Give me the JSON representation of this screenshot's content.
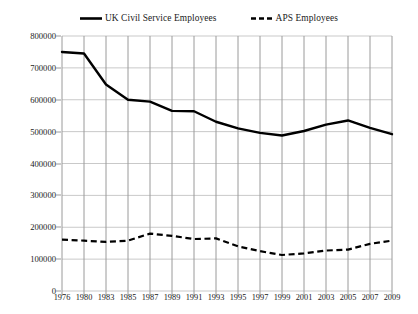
{
  "chart_data": {
    "type": "line",
    "title": "",
    "xlabel": "",
    "ylabel": "",
    "categories": [
      "1976",
      "1980",
      "1983",
      "1985",
      "1987",
      "1989",
      "1991",
      "1993",
      "1995",
      "1997",
      "1999",
      "2001",
      "2003",
      "2005",
      "2007",
      "2009"
    ],
    "series": [
      {
        "name": "UK Civil Service Employees",
        "style": "solid",
        "color": "#000000",
        "values": [
          750000,
          745000,
          648000,
          600000,
          594000,
          565000,
          564000,
          531000,
          510000,
          496000,
          488000,
          502000,
          522000,
          535000,
          512000,
          492000
        ]
      },
      {
        "name": "APS Employees",
        "style": "dashed",
        "color": "#000000",
        "values": [
          161000,
          158000,
          154000,
          158000,
          180000,
          173000,
          163000,
          165000,
          140000,
          125000,
          113000,
          118000,
          127000,
          130000,
          148000,
          158000
        ]
      }
    ],
    "ylim": [
      0,
      800000
    ],
    "yticks": [
      "0",
      "100000",
      "200000",
      "300000",
      "400000",
      "500000",
      "600000",
      "700000",
      "800000"
    ],
    "grid": "horizontal-and-vertical",
    "legend_position": "top-center",
    "gridline_color": "#c9c9c9",
    "vertical_gridline_color": "#9a9a9a"
  },
  "legend": {
    "entries": [
      {
        "label": "UK Civil Service Employees",
        "icon": "solid-line-swatch"
      },
      {
        "label": "APS Employees",
        "icon": "dashed-line-swatch"
      }
    ]
  }
}
